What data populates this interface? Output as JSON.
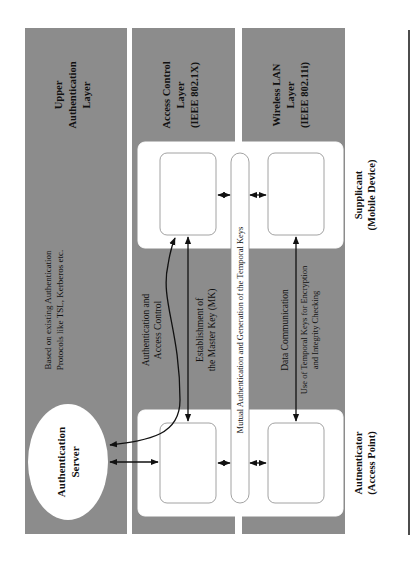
{
  "layers": {
    "upper": {
      "line1": "Upper",
      "line2": "Authentication",
      "line3": "Layer"
    },
    "access_control": {
      "line1": "Access Control",
      "line2": "Layer",
      "line3": "(IEEE 802.1X)"
    },
    "wireless": {
      "line1": "Wireless LAN",
      "line2": "Layer",
      "line3": "(IEEE 802.11i)"
    }
  },
  "entities": {
    "server": {
      "line1": "Authentication",
      "line2": "Server"
    },
    "authenticator": {
      "line1": "Autnenticator",
      "line2": "(Access Point)"
    },
    "supplicant": {
      "line1": "Supplicant",
      "line2": "(Mobile Device)"
    }
  },
  "annotations": {
    "protocols": {
      "line1": "Based on existing Authentication",
      "line2": "Protocols like TSL, Kerberos etc."
    },
    "auth_access": {
      "line1": "Authentication and",
      "line2": "Access Control"
    },
    "master_key": {
      "line1": "Establishment of",
      "line2": "the Master Key (MK)"
    },
    "temporal": "Mutual Authentication and Generation of the Temporal Keys",
    "data_comm": {
      "line1": "Data Communication",
      "line2": "Use of Temporal Keys for Encryption",
      "line3": "and Integrity Checking"
    }
  },
  "colors": {
    "band": "#8c8c8c",
    "box": "#ffffff",
    "line": "#111111"
  }
}
